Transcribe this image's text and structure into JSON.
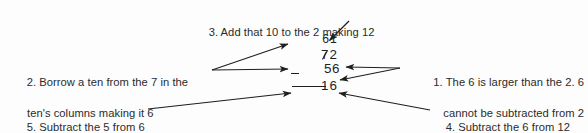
{
  "diagram": {
    "background_color": "#fdfdfd",
    "ink_color": "#2b2b2b"
  },
  "problem": {
    "borrow_row": "61",
    "minuend_struck_digit": "7",
    "minuend_remaining_digit": "2",
    "minuend": "72",
    "operator": "−",
    "subtrahend": "56",
    "answer": "16"
  },
  "annotations": [
    {
      "number": "1",
      "line1": "1. The 6 is larger than the 2. 6",
      "line2": "cannot be subtracted from 2",
      "position": "right"
    },
    {
      "number": "2",
      "line1": "2. Borrow a ten from the 7 in the",
      "line2": "ten's columns making it 6",
      "position": "left"
    },
    {
      "number": "3",
      "line1": "3. Add that 10 to the 2 making 12",
      "line2": "",
      "position": "top"
    },
    {
      "number": "4",
      "line1": "4. Subtract the 6 from 12",
      "line2": "",
      "position": "bottom-right"
    },
    {
      "number": "5",
      "line1": "5. Subtract the 5 from 6",
      "line2": "(in the ten's column)",
      "position": "bottom-left"
    }
  ]
}
